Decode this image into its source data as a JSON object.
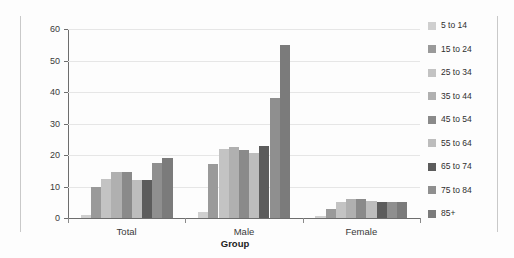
{
  "chart_data": {
    "type": "bar",
    "title": "",
    "xlabel": "Group",
    "ylabel": "Rate per 100,000",
    "categories": [
      "Total",
      "Male",
      "Female"
    ],
    "ylim": [
      0,
      60
    ],
    "yticks": [
      0,
      10,
      20,
      30,
      40,
      50,
      60
    ],
    "ytick_labels": [
      "0",
      "10",
      "20",
      "30",
      "40",
      "50",
      "60"
    ],
    "grid": true,
    "legend_position": "right",
    "series": [
      {
        "name": "5 to 14",
        "color": "#cfcfcf",
        "values": [
          1.0,
          2.0,
          0.5
        ]
      },
      {
        "name": "15 to 24",
        "color": "#9a9a9a",
        "values": [
          10.0,
          17.0,
          3.0
        ]
      },
      {
        "name": "25 to 34",
        "color": "#c3c3c3",
        "values": [
          12.5,
          22.0,
          5.0
        ]
      },
      {
        "name": "35 to 44",
        "color": "#b0b0b0",
        "values": [
          14.5,
          22.5,
          6.0
        ]
      },
      {
        "name": "45 to 54",
        "color": "#8a8a8a",
        "values": [
          14.5,
          21.5,
          6.0
        ]
      },
      {
        "name": "55 to 64",
        "color": "#bdbdbd",
        "values": [
          12.0,
          20.5,
          5.5
        ]
      },
      {
        "name": "65 to 74",
        "color": "#5c5c5c",
        "values": [
          12.0,
          23.0,
          5.0
        ]
      },
      {
        "name": "75 to 84",
        "color": "#8f8f8f",
        "values": [
          17.5,
          38.0,
          5.0
        ]
      },
      {
        "name": "85+",
        "color": "#7b7b7b",
        "values": [
          19.0,
          55.0,
          5.0
        ]
      }
    ]
  },
  "legend": {
    "items": [
      {
        "label": "5 to 14"
      },
      {
        "label": "15 to 24"
      },
      {
        "label": "25 to 34"
      },
      {
        "label": "35 to 44"
      },
      {
        "label": "45 to 54"
      },
      {
        "label": "55 to 64"
      },
      {
        "label": "65 to 74"
      },
      {
        "label": "75 to 84"
      },
      {
        "label": "85+"
      }
    ]
  }
}
